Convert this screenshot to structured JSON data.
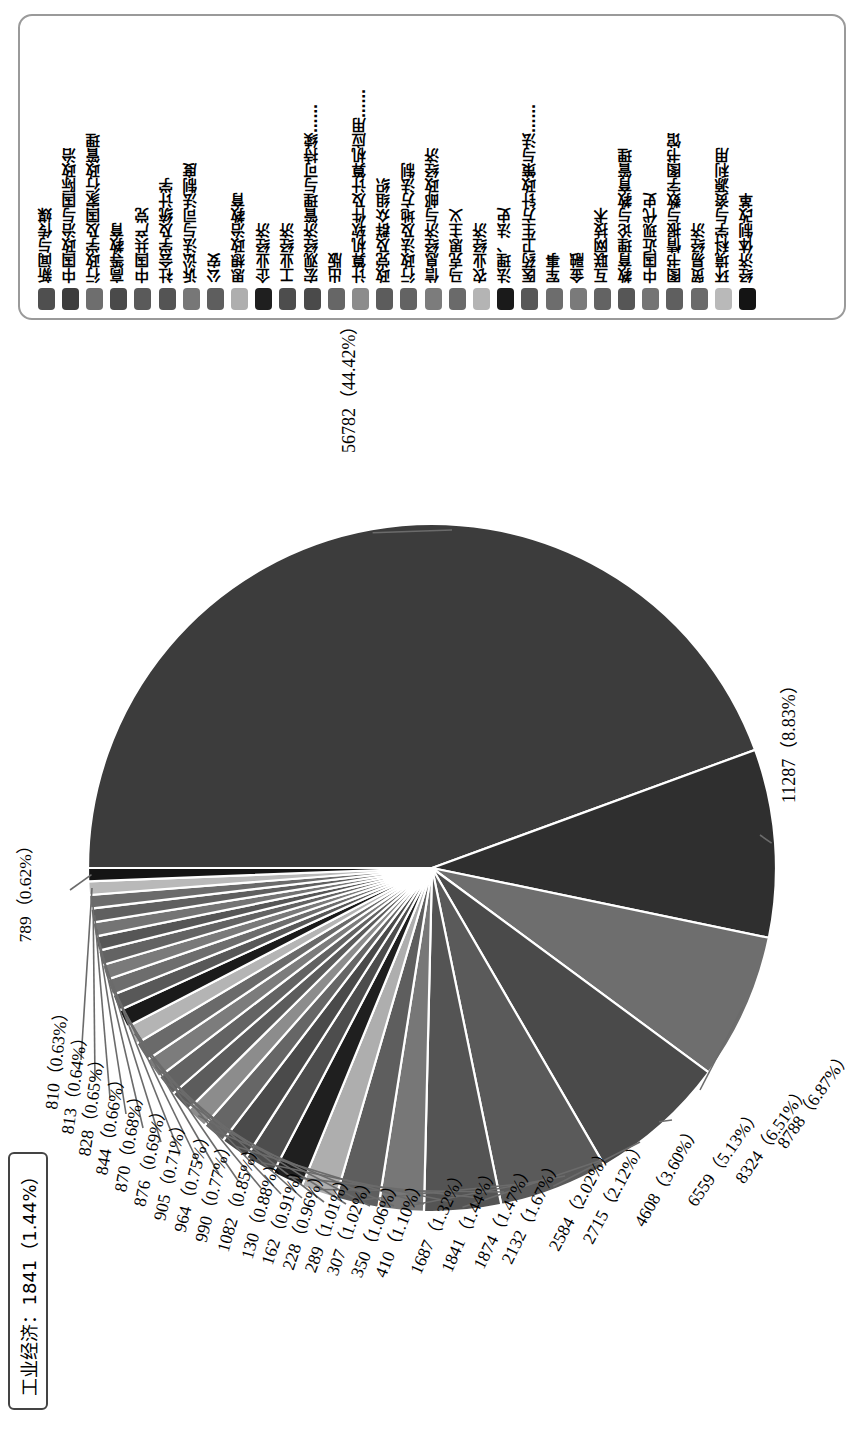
{
  "chart_data": {
    "type": "pie",
    "title": "",
    "legend_position": "top",
    "tooltip": "工业经济：1841（1.44%）",
    "total": 127828,
    "categories": [
      "新闻与传媒",
      "中国政治与国际政治",
      "行政学及国家行政管理",
      "高等教育",
      "中国共产党",
      "社会学及统计学",
      "诉讼法与司法制度",
      "公安",
      "思想政治教育",
      "企业经济",
      "工业经济",
      "宏观经济管理与可持续……",
      "出版",
      "计算机软件及计算机应用……",
      "政党及群众组织",
      "行政法及地方法制",
      "信息经济与邮政经济",
      "马克思主义",
      "农业经济",
      "法理、法史",
      "医药卫生方针政策与法……",
      "军事",
      "金融",
      "互联网技术",
      "教育理论与教育管理",
      "中国近现代史",
      "图书情报与数字图书馆",
      "贸易经济",
      "环境科学与资源利用",
      "经济体制改革"
    ],
    "slices": [
      {
        "value": 56782,
        "percent": 44.42,
        "label": "56782（44.42%）"
      },
      {
        "value": 11287,
        "percent": 8.83,
        "label": "11287（8.83%）"
      },
      {
        "value": 8788,
        "percent": 6.87,
        "label": "8788（6.87%）"
      },
      {
        "value": 8324,
        "percent": 6.51,
        "label": "8324（6.51%）"
      },
      {
        "value": 6559,
        "percent": 5.13,
        "label": "6559（5.13%）"
      },
      {
        "value": 4608,
        "percent": 3.6,
        "label": "4608（3.60%）"
      },
      {
        "value": 2715,
        "percent": 2.12,
        "label": "2715（2.12%）"
      },
      {
        "value": 2584,
        "percent": 2.02,
        "label": "2584（2.02%）"
      },
      {
        "value": 2132,
        "percent": 1.67,
        "label": "2132（1.67%）"
      },
      {
        "value": 1874,
        "percent": 1.47,
        "label": "1874（1.47%）"
      },
      {
        "value": 1841,
        "percent": 1.44,
        "label": "1841（1.44%）"
      },
      {
        "value": 1687,
        "percent": 1.32,
        "label": "1687（1.32%）"
      },
      {
        "value": 1410,
        "percent": 1.1,
        "label": "410（1.10%）"
      },
      {
        "value": 1350,
        "percent": 1.06,
        "label": "350（1.06%）"
      },
      {
        "value": 1307,
        "percent": 1.02,
        "label": "307（1.02%）"
      },
      {
        "value": 1289,
        "percent": 1.01,
        "label": "289（1.01%）"
      },
      {
        "value": 1228,
        "percent": 0.96,
        "label": "228（0.96%）"
      },
      {
        "value": 1162,
        "percent": 0.91,
        "label": "162（0.91%）"
      },
      {
        "value": 1130,
        "percent": 0.88,
        "label": "130（0.88%）"
      },
      {
        "value": 1082,
        "percent": 0.85,
        "label": "1082（0.85%）"
      },
      {
        "value": 990,
        "percent": 0.77,
        "label": "990（0.77%）"
      },
      {
        "value": 964,
        "percent": 0.75,
        "label": "964（0.75%）"
      },
      {
        "value": 905,
        "percent": 0.71,
        "label": "905（0.71%）"
      },
      {
        "value": 876,
        "percent": 0.69,
        "label": "876（0.69%）"
      },
      {
        "value": 870,
        "percent": 0.68,
        "label": "870（0.68%）"
      },
      {
        "value": 844,
        "percent": 0.66,
        "label": "844（0.66%）"
      },
      {
        "value": 828,
        "percent": 0.65,
        "label": "828（0.65%）"
      },
      {
        "value": 813,
        "percent": 0.64,
        "label": "813（0.64%）"
      },
      {
        "value": 810,
        "percent": 0.63,
        "label": "810（0.63%）"
      },
      {
        "value": 789,
        "percent": 0.62,
        "label": "789（0.62%）"
      }
    ],
    "legend_swatch_colors": [
      "#4f4f4f",
      "#3d3d3d",
      "#6e6e6e",
      "#4a4a4a",
      "#5a5a5a",
      "#545454",
      "#777777",
      "#5e5e5e",
      "#aeaeae",
      "#1f1f1f",
      "#4d4d4d",
      "#4a4a4a",
      "#666666",
      "#8c8c8c",
      "#5c5c5c",
      "#636363",
      "#7c7c7c",
      "#6a6a6a",
      "#b4b4b4",
      "#1a1a1a",
      "#585858",
      "#6d6d6d",
      "#7a7a7a",
      "#636363",
      "#565656",
      "#747474",
      "#5f5f5f",
      "#6b6b6b",
      "#b9b9b9",
      "#141414"
    ],
    "slice_colors": [
      "#3c3c3c",
      "#2f2f2f",
      "#6e6e6e",
      "#4a4a4a",
      "#5a5a5a",
      "#545454",
      "#777777",
      "#5e5e5e",
      "#aeaeae",
      "#1f1f1f",
      "#4d4d4d",
      "#4a4a4a",
      "#666666",
      "#8c8c8c",
      "#5c5c5c",
      "#636363",
      "#7c7c7c",
      "#6a6a6a",
      "#b4b4b4",
      "#1a1a1a",
      "#585858",
      "#6d6d6d",
      "#7a7a7a",
      "#636363",
      "#565656",
      "#747474",
      "#5f5f5f",
      "#6b6b6b",
      "#b9b9b9",
      "#141414"
    ]
  },
  "legend": {
    "items": [
      {
        "label": "新闻与传媒"
      },
      {
        "label": "中国政治与国际政治"
      },
      {
        "label": "行政学及国家行政管理"
      },
      {
        "label": "高等教育"
      },
      {
        "label": "中国共产党"
      },
      {
        "label": "社会学及统计学"
      },
      {
        "label": "诉讼法与司法制度"
      },
      {
        "label": "公安"
      },
      {
        "label": "思想政治教育"
      },
      {
        "label": "企业经济"
      },
      {
        "label": "工业经济"
      },
      {
        "label": "宏观经济管理与可持续……"
      },
      {
        "label": "出版"
      },
      {
        "label": "计算机软件及计算机应用……"
      },
      {
        "label": "政党及群众组织"
      },
      {
        "label": "行政法及地方法制"
      },
      {
        "label": "信息经济与邮政经济"
      },
      {
        "label": "马克思主义"
      },
      {
        "label": "农业经济"
      },
      {
        "label": "法理、法史"
      },
      {
        "label": "医药卫生方针政策与法……"
      },
      {
        "label": "军事"
      },
      {
        "label": "金融"
      },
      {
        "label": "互联网技术"
      },
      {
        "label": "教育理论与教育管理"
      },
      {
        "label": "中国近现代史"
      },
      {
        "label": "图书情报与数字图书馆"
      },
      {
        "label": "贸易经济"
      },
      {
        "label": "环境科学与资源利用"
      },
      {
        "label": "经济体制改革"
      }
    ]
  },
  "tooltip": {
    "text": "工业经济：1841（1.44%）"
  }
}
